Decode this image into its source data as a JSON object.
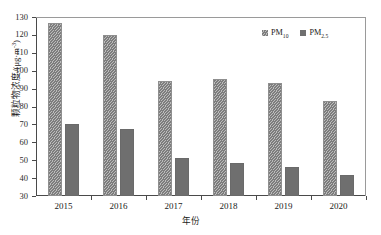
{
  "chart_data": {
    "type": "bar",
    "title": "",
    "subtitle": "",
    "xlabel": "年份",
    "ylabel": "颗粒物浓度/(μg·m⁻³)",
    "ylabel_main": "颗粒物浓度/(μg·m",
    "ylabel_sup": "-3",
    "ylabel_tail": ")",
    "categories": [
      "2015",
      "2016",
      "2017",
      "2018",
      "2019",
      "2020"
    ],
    "series": [
      {
        "name": "PM10",
        "name_base": "PM",
        "name_sub": "10",
        "color": "#8b8b8b",
        "fill": "diagonal-hatch",
        "values": [
          126.5,
          120.0,
          94.0,
          95.5,
          93.0,
          83.0
        ]
      },
      {
        "name": "PM2.5",
        "name_base": "PM",
        "name_sub": "2.5",
        "color": "#6f6f6f",
        "fill": "solid",
        "values": [
          70.5,
          67.5,
          51.0,
          48.5,
          46.0,
          41.5
        ]
      }
    ],
    "ylim": [
      30,
      130
    ],
    "ytick_values": [
      30,
      40,
      50,
      60,
      70,
      80,
      90,
      100,
      110,
      120,
      130
    ],
    "ytick_labels": [
      "30",
      "40",
      "50",
      "60",
      "70",
      "80",
      "90",
      "100",
      "110",
      "120",
      "130"
    ],
    "grid": false,
    "legend_position": "top-right",
    "axis_color": "#4a4a4a",
    "background": "#ffffff"
  }
}
